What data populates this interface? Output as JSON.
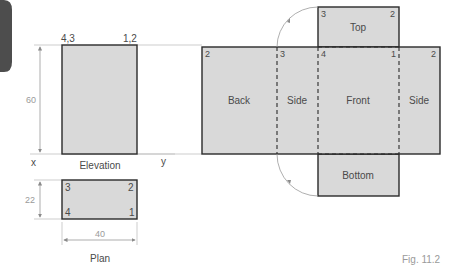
{
  "colors": {
    "face_fill": "#d9d9d9",
    "outline": "#2a2a2a",
    "projector": "#b8b8b8",
    "label": "#4a4a4a",
    "dimension": "#9a9a9a",
    "tab": "#4d4d4d"
  },
  "elevation": {
    "title": "Elevation",
    "corner_left": "4,3",
    "corner_right": "1,2",
    "height_dim": "60",
    "axis_x": "x",
    "axis_y": "y"
  },
  "plan": {
    "title": "Plan",
    "corners": {
      "top_left": "3",
      "top_right": "2",
      "bottom_left": "4",
      "bottom_right": "1"
    },
    "depth_dim": "22",
    "width_dim": "40"
  },
  "net": {
    "faces": {
      "top": "Top",
      "back": "Back",
      "side_left": "Side",
      "front": "Front",
      "side_right": "Side",
      "bottom": "Bottom"
    },
    "corner_numbers": {
      "top_tl": "3",
      "top_tr": "2",
      "back_tl": "2",
      "side_left_tl": "3",
      "front_tl": "4",
      "front_tr": "1",
      "side_right_tr": "2"
    }
  },
  "caption": "Fig. 11.2"
}
